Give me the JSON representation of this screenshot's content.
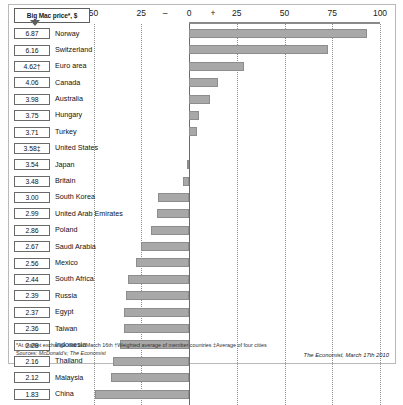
{
  "header": {
    "price_tag_label": "Big Mac price*, $"
  },
  "chart_data": {
    "type": "bar",
    "title": "Big Mac price*, $",
    "orientation": "horizontal",
    "xlabel": "",
    "ylabel": "",
    "xlim": [
      -50,
      100
    ],
    "grid": true,
    "legend": "none",
    "axis_note": "Local currency under(-)/over(+) valuation against the dollar, %",
    "tick_labels": [
      "50",
      "25",
      "–",
      "0",
      "+",
      "25",
      "50",
      "75",
      "100"
    ],
    "tick_values": [
      -50,
      -25,
      -12.5,
      0,
      12.5,
      25,
      50,
      75,
      100
    ],
    "categories": [
      "Norway",
      "Switzerland",
      "Euro area",
      "Canada",
      "Australia",
      "Hungary",
      "Turkey",
      "United States",
      "Japan",
      "Britain",
      "South Korea",
      "United Arab Emirates",
      "Poland",
      "Saudi Arabia",
      "Mexico",
      "South Africa",
      "Russia",
      "Egypt",
      "Taiwan",
      "Indonesia",
      "Thailand",
      "Malaysia",
      "China"
    ],
    "prices": [
      "6.87",
      "6.16",
      "4.62†",
      "4.06",
      "3.98",
      "3.75",
      "3.71",
      "3.58‡",
      "3.54",
      "3.48",
      "3.00",
      "2.99",
      "2.86",
      "2.67",
      "2.56",
      "2.44",
      "2.39",
      "2.37",
      "2.36",
      "2.28",
      "2.16",
      "2.12",
      "1.83"
    ],
    "values": [
      93,
      73,
      29,
      15,
      11,
      5,
      4,
      0,
      -1,
      -3,
      -16,
      -17,
      -20,
      -25,
      -28,
      -32,
      -33,
      -34,
      -34,
      -36,
      -40,
      -41,
      -49
    ],
    "bar_color": "#a8a8a8",
    "bar_edge_color": "#8d8d8d"
  },
  "footnotes": {
    "line1": "*At market exchange rate on March 16th  †Weighted average of member countries  ‡Average of four cities",
    "sources_prefix": "Sources: ",
    "sources": "McDonald's; The Economist"
  },
  "credit": "The Economist, March 17th 2010"
}
